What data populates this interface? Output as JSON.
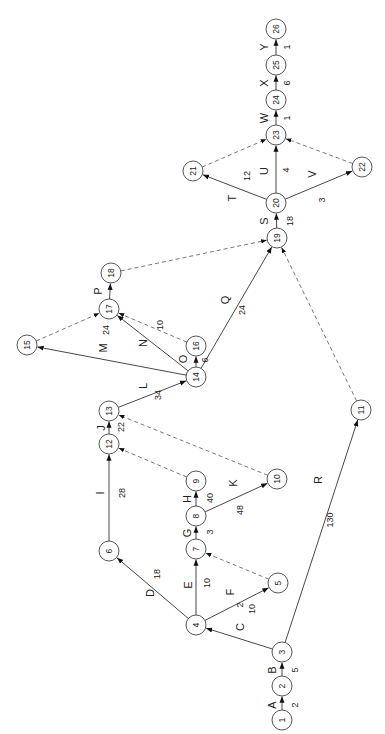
{
  "diagram": {
    "type": "activity-on-arrow network (PERT/CPM)",
    "orientation": "rotated -90deg (reads bottom-to-top)",
    "nodes": [
      {
        "id": "1",
        "x": 282,
        "y": 720
      },
      {
        "id": "2",
        "x": 282,
        "y": 686
      },
      {
        "id": "3",
        "x": 282,
        "y": 652
      },
      {
        "id": "4",
        "x": 196,
        "y": 625
      },
      {
        "id": "5",
        "x": 278,
        "y": 583
      },
      {
        "id": "6",
        "x": 109,
        "y": 551
      },
      {
        "id": "7",
        "x": 196,
        "y": 549
      },
      {
        "id": "8",
        "x": 196,
        "y": 516
      },
      {
        "id": "9",
        "x": 196,
        "y": 481
      },
      {
        "id": "10",
        "x": 277,
        "y": 479
      },
      {
        "id": "11",
        "x": 361,
        "y": 410
      },
      {
        "id": "12",
        "x": 109,
        "y": 444
      },
      {
        "id": "13",
        "x": 109,
        "y": 411
      },
      {
        "id": "14",
        "x": 196,
        "y": 377
      },
      {
        "id": "15",
        "x": 27,
        "y": 345
      },
      {
        "id": "16",
        "x": 196,
        "y": 346
      },
      {
        "id": "17",
        "x": 109,
        "y": 309
      },
      {
        "id": "18",
        "x": 111,
        "y": 273
      },
      {
        "id": "19",
        "x": 277,
        "y": 238
      },
      {
        "id": "20",
        "x": 276,
        "y": 203
      },
      {
        "id": "21",
        "x": 193,
        "y": 171
      },
      {
        "id": "22",
        "x": 362,
        "y": 167
      },
      {
        "id": "23",
        "x": 276,
        "y": 135
      },
      {
        "id": "24",
        "x": 276,
        "y": 100
      },
      {
        "id": "25",
        "x": 276,
        "y": 65
      },
      {
        "id": "26",
        "x": 276,
        "y": 29
      }
    ],
    "activities": [
      {
        "name": "A",
        "from": "1",
        "to": "2",
        "duration": "2",
        "lx": 272,
        "ly": 705,
        "dx": 295,
        "dy": 705
      },
      {
        "name": "B",
        "from": "2",
        "to": "3",
        "duration": "5",
        "lx": 272,
        "ly": 670,
        "dx": 295,
        "dy": 670
      },
      {
        "name": "C",
        "from": "3",
        "to": "4",
        "duration": "10",
        "lx": 240,
        "ly": 627,
        "dx": 252,
        "dy": 609
      },
      {
        "name": "D",
        "from": "4",
        "to": "6",
        "duration": "18",
        "lx": 150,
        "ly": 593,
        "dx": 157,
        "dy": 574
      },
      {
        "name": "E",
        "from": "4",
        "to": "7",
        "duration": "10",
        "lx": 188,
        "ly": 585,
        "dx": 207,
        "dy": 583
      },
      {
        "name": "F",
        "from": "4",
        "to": "5",
        "duration": "2",
        "lx": 230,
        "ly": 592,
        "dx": 240,
        "dy": 605
      },
      {
        "name": "G",
        "from": "7",
        "to": "8",
        "duration": "3",
        "lx": 187,
        "ly": 533,
        "dx": 210,
        "dy": 532
      },
      {
        "name": "H",
        "from": "8",
        "to": "9",
        "duration": "40",
        "lx": 187,
        "ly": 499,
        "dx": 210,
        "dy": 498
      },
      {
        "name": "I",
        "from": "6",
        "to": "12",
        "duration": "28",
        "lx": 100,
        "ly": 493,
        "dx": 122,
        "dy": 493
      },
      {
        "name": "J",
        "from": "12",
        "to": "13",
        "duration": "22",
        "lx": 101,
        "ly": 428,
        "dx": 121,
        "dy": 427
      },
      {
        "name": "K",
        "from": "8",
        "to": "10",
        "duration": "48",
        "lx": 233,
        "ly": 483,
        "dx": 240,
        "dy": 510
      },
      {
        "name": "L",
        "from": "13",
        "to": "14",
        "duration": "34",
        "lx": 143,
        "ly": 386,
        "dx": 158,
        "dy": 395
      },
      {
        "name": "M",
        "from": "14",
        "to": "15",
        "duration": "24",
        "lx": 103,
        "ly": 348,
        "dx": 106,
        "dy": 330
      },
      {
        "name": "N",
        "from": "14",
        "to": "17",
        "duration": "",
        "lx": 143,
        "ly": 343,
        "dx": 0,
        "dy": 0
      },
      {
        "name": "O",
        "from": "14",
        "to": "16",
        "duration": "6",
        "lx": 183,
        "ly": 359,
        "dx": 205,
        "dy": 360
      },
      {
        "name": "P",
        "from": "17",
        "to": "18",
        "duration": "",
        "lx": 98,
        "ly": 291,
        "dx": 0,
        "dy": 0
      },
      {
        "name": "Q",
        "from": "14",
        "to": "19",
        "duration": "24",
        "lx": 225,
        "ly": 300,
        "dx": 242,
        "dy": 310
      },
      {
        "name": "R",
        "from": "3",
        "to": "11",
        "duration": "130",
        "lx": 318,
        "ly": 480,
        "dx": 330,
        "dy": 520
      },
      {
        "name": "S",
        "from": "19",
        "to": "20",
        "duration": "18",
        "lx": 264,
        "ly": 221,
        "dx": 290,
        "dy": 221
      },
      {
        "name": "T",
        "from": "20",
        "to": "21",
        "duration": "12",
        "lx": 232,
        "ly": 198,
        "dx": 247,
        "dy": 176
      },
      {
        "name": "U",
        "from": "20",
        "to": "23",
        "duration": "4",
        "lx": 264,
        "ly": 171,
        "dx": 286,
        "dy": 170
      },
      {
        "name": "V",
        "from": "20",
        "to": "22",
        "duration": "3",
        "lx": 312,
        "ly": 174,
        "dx": 322,
        "dy": 200
      },
      {
        "name": "W",
        "from": "23",
        "to": "24",
        "duration": "1",
        "lx": 264,
        "ly": 118,
        "dx": 287,
        "dy": 118
      },
      {
        "name": "X",
        "from": "24",
        "to": "25",
        "duration": "6",
        "lx": 264,
        "ly": 83,
        "dx": 287,
        "dy": 83
      },
      {
        "name": "Y",
        "from": "25",
        "to": "26",
        "duration": "1",
        "lx": 264,
        "ly": 47,
        "dx": 287,
        "dy": 47
      }
    ],
    "dummy_edges": [
      {
        "from": "5",
        "to": "7",
        "duration": ""
      },
      {
        "from": "9",
        "to": "12",
        "duration": ""
      },
      {
        "from": "10",
        "to": "13",
        "duration": ""
      },
      {
        "from": "15",
        "to": "17",
        "duration": ""
      },
      {
        "from": "16",
        "to": "17",
        "duration": "10",
        "dx": 160,
        "dy": 325
      },
      {
        "from": "18",
        "to": "19",
        "duration": ""
      },
      {
        "from": "11",
        "to": "19",
        "duration": ""
      },
      {
        "from": "21",
        "to": "23",
        "duration": ""
      },
      {
        "from": "22",
        "to": "23",
        "duration": ""
      }
    ]
  }
}
